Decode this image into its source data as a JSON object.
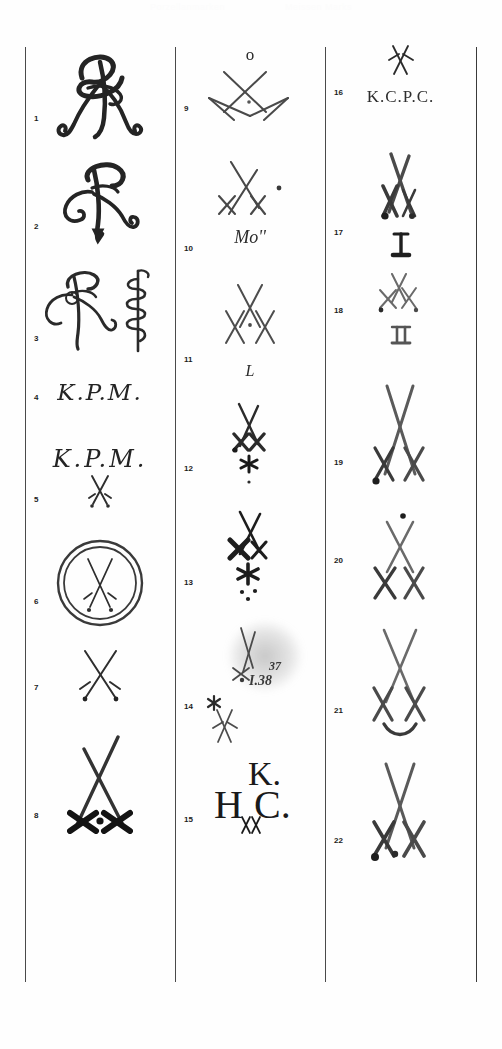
{
  "page": {
    "watermark_left": "Porzellanmarken",
    "watermark_right": "Meissen Marks",
    "background_color": "#ffffff",
    "ink_color": "#2b2b2b",
    "rule_color": "#4a4a4a",
    "width": 502,
    "height": 1049
  },
  "columns": [
    {
      "id": "column-1",
      "entries": [
        {
          "number": "1",
          "type": "monogram",
          "caption": "",
          "description": "ornate AR cipher monogram, heavy flourished script",
          "has_swords": false
        },
        {
          "number": "2",
          "type": "monogram",
          "caption": "",
          "description": "AR cipher monogram with downward arrow tail",
          "has_swords": false
        },
        {
          "number": "3",
          "type": "monogram",
          "caption": "",
          "description": "AR cipher monogram with serpent coil mark at right",
          "has_swords": false
        },
        {
          "number": "4",
          "type": "lettering",
          "caption": "K.P.M.",
          "description": "script K.P.M. monogram",
          "has_swords": false
        },
        {
          "number": "5",
          "type": "lettering-swords",
          "caption": "K.P.M.",
          "description": "script K.P.M. monogram above small crossed swords",
          "has_swords": true
        },
        {
          "number": "6",
          "type": "swords-in-circle",
          "caption": "",
          "description": "crossed swords inside double drawn circle",
          "has_swords": true
        },
        {
          "number": "7",
          "type": "swords",
          "caption": "",
          "description": "crossed swords, thin strokes, pommel dots",
          "has_swords": true
        },
        {
          "number": "8",
          "type": "swords",
          "caption": "",
          "description": "crossed swords with heavy dark pommels and centre dot",
          "has_swords": true
        }
      ]
    },
    {
      "id": "column-2",
      "entries": [
        {
          "number": "9",
          "type": "swords",
          "caption": "o",
          "description": "small o above wide crossed swords with centre dot",
          "has_swords": true
        },
        {
          "number": "10",
          "type": "swords",
          "caption": "Mo''",
          "description": "crossed swords with dot, inscription Mo'' below",
          "has_swords": true
        },
        {
          "number": "11",
          "type": "swords",
          "caption": "L",
          "description": "crossed swords with dot, letter L below",
          "has_swords": true
        },
        {
          "number": "12",
          "type": "swords",
          "caption": "",
          "description": "crossed swords with asterisk star and dot below",
          "has_swords": true
        },
        {
          "number": "13",
          "type": "swords",
          "caption": "",
          "description": "bold crossed swords with asterisk star and three dots",
          "has_swords": true
        },
        {
          "number": "14",
          "type": "swords-smudge",
          "caption": "37",
          "caption2": "I.38",
          "description": "blurred crossed swords with star inside smudge, numbers 37 and I.38; separate asterisk and small swords at left",
          "has_swords": true
        },
        {
          "number": "15",
          "type": "lettering-swords",
          "caption": "K.",
          "caption2": "H",
          "caption3": "C.",
          "description": "K. above H C monogram with tiny crossed swords",
          "has_swords": true
        }
      ]
    },
    {
      "id": "column-3",
      "entries": [
        {
          "number": "16",
          "type": "swords-lettering",
          "caption": "K.C.P.C.",
          "description": "small crossed swords above K.C.P.C. inscription",
          "has_swords": true
        },
        {
          "number": "17",
          "type": "swords",
          "caption": "I",
          "description": "bold crossed swords with roman numeral I below",
          "has_swords": true
        },
        {
          "number": "18",
          "type": "swords",
          "caption": "II",
          "description": "light crossed swords with roman numeral II below",
          "has_swords": true
        },
        {
          "number": "19",
          "type": "swords",
          "caption": "",
          "description": "tall crossed swords with pommel dot",
          "has_swords": true
        },
        {
          "number": "20",
          "type": "swords",
          "caption": "",
          "description": "crossed swords with dot above",
          "has_swords": true
        },
        {
          "number": "21",
          "type": "swords",
          "caption": "",
          "description": "crossed swords with curved arc below",
          "has_swords": true
        },
        {
          "number": "22",
          "type": "swords",
          "caption": "",
          "description": "crossed swords with heavy pommels",
          "has_swords": true
        }
      ]
    }
  ]
}
